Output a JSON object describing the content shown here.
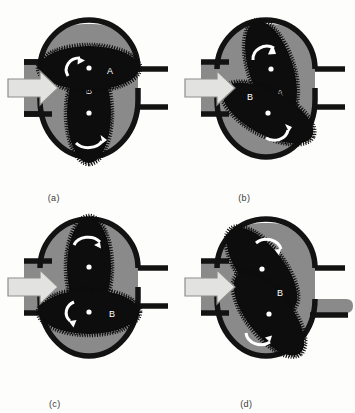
{
  "figure": {
    "colors": {
      "background": "#fdfdfc",
      "housing_outline": "#121212",
      "fluid": "#8a8a8a",
      "rotor": "#0d0d0d",
      "rotor_teeth": "#0d0d0d",
      "arrow_fill": "#e2e2e0",
      "arrow_stroke": "#8e8e8c",
      "rotation_arrow": "#ffffff",
      "shaft_dot": "#ffffff",
      "label_text": "#ffffff",
      "caption_text": "#3a3a3a"
    },
    "rotor_labels": {
      "a": "A",
      "b": "B"
    },
    "panels": [
      {
        "id": "panel-a",
        "caption": "(a)",
        "inlet_arrow": "inlet-flow-arrow",
        "outlet_flow": "none",
        "rotors": [
          {
            "name": "A",
            "label": "A",
            "orientation_deg": 0,
            "position": "upper",
            "rotation": "counterclockwise"
          },
          {
            "name": "B",
            "label": "B",
            "orientation_deg": 90,
            "position": "lower",
            "rotation": "clockwise"
          }
        ]
      },
      {
        "id": "panel-b",
        "caption": "(b)",
        "inlet_arrow": "inlet-flow-arrow",
        "outlet_flow": "none",
        "rotors": [
          {
            "name": "A",
            "label": "A",
            "orientation_deg": 65,
            "position": "upper",
            "rotation": "counterclockwise"
          },
          {
            "name": "B",
            "label": "B",
            "orientation_deg": 25,
            "position": "lower",
            "rotation": "clockwise"
          }
        ]
      },
      {
        "id": "panel-c",
        "caption": "(c)",
        "inlet_arrow": "inlet-flow-arrow",
        "outlet_flow": "none",
        "rotors": [
          {
            "name": "A",
            "label": "A",
            "orientation_deg": 90,
            "position": "upper",
            "rotation": "counterclockwise"
          },
          {
            "name": "B",
            "label": "B",
            "orientation_deg": 0,
            "position": "lower",
            "rotation": "clockwise"
          }
        ]
      },
      {
        "id": "panel-d",
        "caption": "(d)",
        "inlet_arrow": "inlet-flow-arrow",
        "outlet_flow": "discharge-flow",
        "rotors": [
          {
            "name": "A",
            "label": "A",
            "orientation_deg": 45,
            "position": "upper",
            "rotation": "counterclockwise"
          },
          {
            "name": "B",
            "label": "B",
            "orientation_deg": 45,
            "position": "lower",
            "rotation": "clockwise"
          }
        ]
      }
    ]
  }
}
